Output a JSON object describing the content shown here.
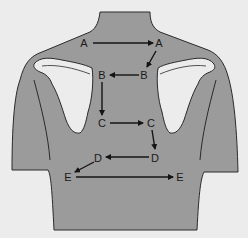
{
  "diagram": {
    "title": "",
    "colors": {
      "background": "#ececec",
      "body": "#9b9b9b",
      "scapula": "#ececec",
      "outline": "#2a2a2a",
      "arrow": "#141414",
      "label": "#1a1a1a"
    },
    "labels": [
      {
        "id": "A1",
        "text": "A",
        "x": 84,
        "y": 43
      },
      {
        "id": "A2",
        "text": "A",
        "x": 159,
        "y": 43
      },
      {
        "id": "B2",
        "text": "B",
        "x": 144,
        "y": 75
      },
      {
        "id": "B1",
        "text": "B",
        "x": 102,
        "y": 75
      },
      {
        "id": "C1",
        "text": "C",
        "x": 102,
        "y": 123
      },
      {
        "id": "C2",
        "text": "C",
        "x": 151,
        "y": 123
      },
      {
        "id": "D2",
        "text": "D",
        "x": 155,
        "y": 158
      },
      {
        "id": "D1",
        "text": "D",
        "x": 98,
        "y": 158
      },
      {
        "id": "E1",
        "text": "E",
        "x": 68,
        "y": 177
      },
      {
        "id": "E2",
        "text": "E",
        "x": 180,
        "y": 177
      }
    ],
    "sequence": [
      "A",
      "A",
      "B",
      "B",
      "C",
      "C",
      "D",
      "D",
      "E",
      "E"
    ],
    "arrows": [
      {
        "from": "A1",
        "to": "A2",
        "x1": 93,
        "y1": 43,
        "x2": 153,
        "y2": 43
      },
      {
        "from": "A2",
        "to": "B2",
        "x1": 156,
        "y1": 51,
        "x2": 147,
        "y2": 67
      },
      {
        "from": "B2",
        "to": "B1",
        "x1": 139,
        "y1": 75,
        "x2": 110,
        "y2": 75
      },
      {
        "from": "B1",
        "to": "C1",
        "x1": 102,
        "y1": 82,
        "x2": 102,
        "y2": 115
      },
      {
        "from": "C1",
        "to": "C2",
        "x1": 110,
        "y1": 123,
        "x2": 143,
        "y2": 123
      },
      {
        "from": "C2",
        "to": "D2",
        "x1": 152,
        "y1": 130,
        "x2": 155,
        "y2": 149
      },
      {
        "from": "D2",
        "to": "D1",
        "x1": 149,
        "y1": 157,
        "x2": 106,
        "y2": 157
      },
      {
        "from": "D1",
        "to": "E1",
        "x1": 94,
        "y1": 162,
        "x2": 75,
        "y2": 172
      },
      {
        "from": "E1",
        "to": "E2",
        "x1": 76,
        "y1": 177,
        "x2": 173,
        "y2": 177
      }
    ]
  }
}
